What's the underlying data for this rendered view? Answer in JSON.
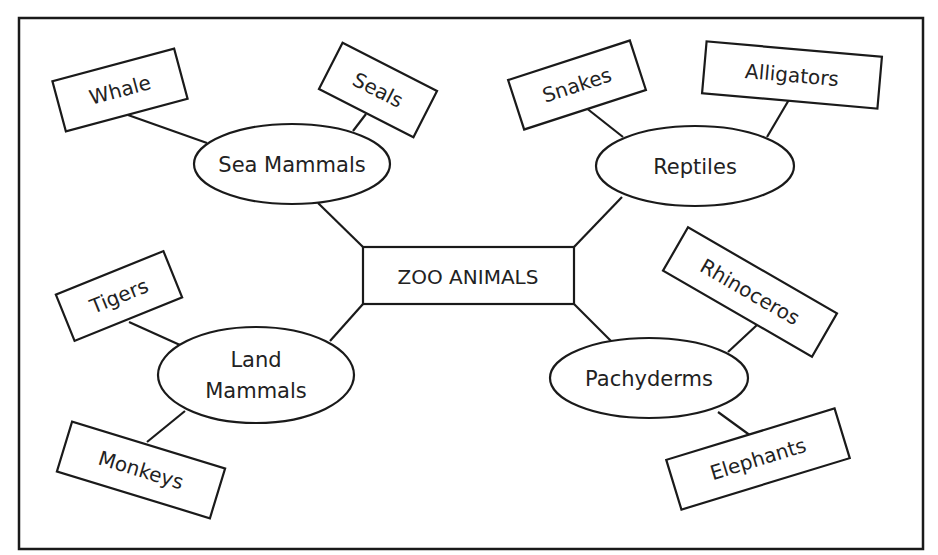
{
  "diagram": {
    "type": "concept-map",
    "colors": {
      "stroke": "#1a1a1a",
      "text": "#222222",
      "background": "#ffffff"
    },
    "center": {
      "label": "ZOO ANIMALS"
    },
    "categories": [
      {
        "label": "Sea Mammals",
        "children": [
          "Whale",
          "Seals"
        ]
      },
      {
        "label": "Reptiles",
        "children": [
          "Snakes",
          "Alligators"
        ]
      },
      {
        "label": "Land Mammals",
        "label_lines": [
          "Land",
          "Mammals"
        ],
        "children": [
          "Tigers",
          "Monkeys"
        ]
      },
      {
        "label": "Pachyderms",
        "children": [
          "Rhinoceros",
          "Elephants"
        ]
      }
    ]
  }
}
